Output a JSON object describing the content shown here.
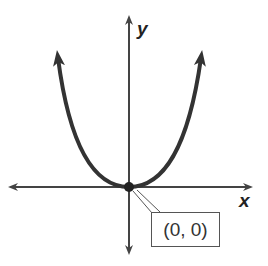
{
  "diagram": {
    "type": "parabola graph",
    "equation_shape": "y = a x^2, a > 0",
    "axes": {
      "x_label": "x",
      "y_label": "y"
    },
    "vertex": {
      "x": 0,
      "y": 0,
      "label": "(0, 0)"
    }
  },
  "colors": {
    "curve": "#333333",
    "axes": "#444444",
    "background": "#ffffff"
  }
}
